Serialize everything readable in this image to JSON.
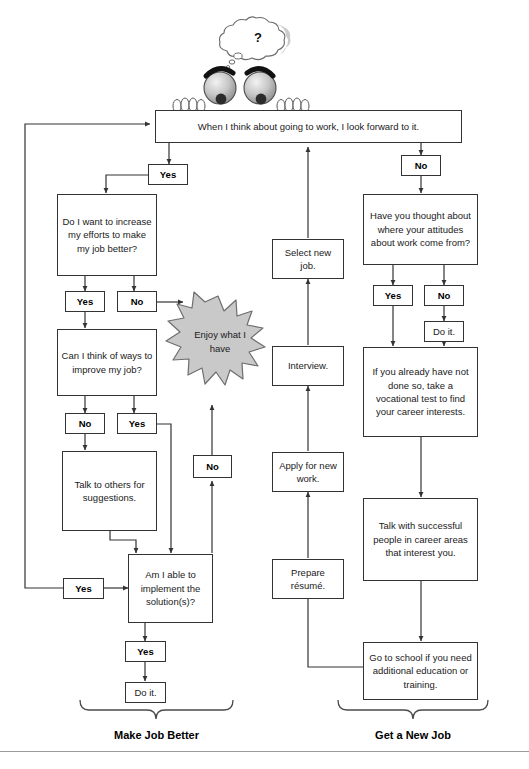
{
  "diagram": {
    "title_left": "Make Job Better",
    "title_right": "Get a New Job",
    "thought_bubble": "?",
    "start": {
      "text": "When I think about going to work, I look forward to it."
    },
    "left_branch": {
      "yes_top": "Yes",
      "q1": "Do I want to increase my efforts to make my job better?",
      "q1_yes": "Yes",
      "q1_no": "No",
      "q2": "Can I think of ways to improve my job?",
      "q2_no": "No",
      "q2_yes": "Yes",
      "talk": "Talk to others for suggestions.",
      "q3": "Am I able to implement the solution(s)?",
      "q3_yes_left": "Yes",
      "q3_yes_down": "Yes",
      "q3_no": "No",
      "do_it": "Do it.",
      "starburst": "Enjoy what I have"
    },
    "middle_branch": {
      "select_new_job": "Select new job.",
      "interview": "Interview.",
      "apply": "Apply for new work.",
      "prepare": "Prepare résumé."
    },
    "right_branch": {
      "no_top": "No",
      "q1": "Have you thought about where your attitudes about work come from?",
      "q1_yes": "Yes",
      "q1_no": "No",
      "do_it": "Do it.",
      "vocational": "If you already have not done so, take a vocational test to find your career interests.",
      "talk_with": "Talk with successful people in career areas that interest you.",
      "school": "Go to school if you need additional education or training."
    }
  },
  "colors": {
    "line": "#333333",
    "starburst_fill": "#c9c9c9",
    "starburst_stroke": "#6e6e6e",
    "text": "#1a1a1a"
  }
}
